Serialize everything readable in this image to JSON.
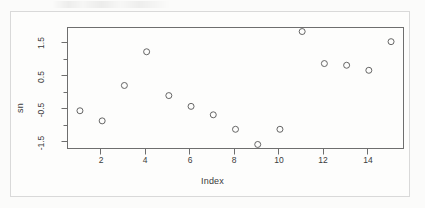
{
  "figure": {
    "background_color": "#fbfbfa",
    "frame_color": "#d9d9d9",
    "axis_color": "#6e6e6e",
    "point_color": "#555555"
  },
  "chart_data": {
    "type": "scatter",
    "title": "",
    "xlabel": "Index",
    "ylabel": "sn",
    "x": [
      1,
      2,
      3,
      4,
      5,
      6,
      7,
      8,
      9,
      10,
      11,
      12,
      13,
      14,
      15
    ],
    "values": [
      -0.5,
      -0.8,
      0.25,
      1.25,
      -0.05,
      -0.37,
      -0.62,
      -1.05,
      -1.5,
      -1.05,
      1.85,
      0.9,
      0.85,
      0.7,
      1.55
    ],
    "xlim": [
      0.44,
      15.56
    ],
    "ylim": [
      -1.62,
      1.97
    ],
    "xticks": [
      2,
      4,
      6,
      8,
      10,
      12,
      14
    ],
    "xtick_labels": [
      "2",
      "4",
      "6",
      "8",
      "10",
      "12",
      "14"
    ],
    "yticks": [
      1.5,
      0.5,
      -0.5,
      -1.5
    ],
    "ytick_labels": [
      "1.5",
      "0.5",
      "-0.5",
      "-1.5"
    ],
    "yticks_minor": [
      1.0,
      0.0,
      -1.0
    ],
    "grid": false,
    "legend": null,
    "marker": "open-circle",
    "marker_size": 3
  }
}
